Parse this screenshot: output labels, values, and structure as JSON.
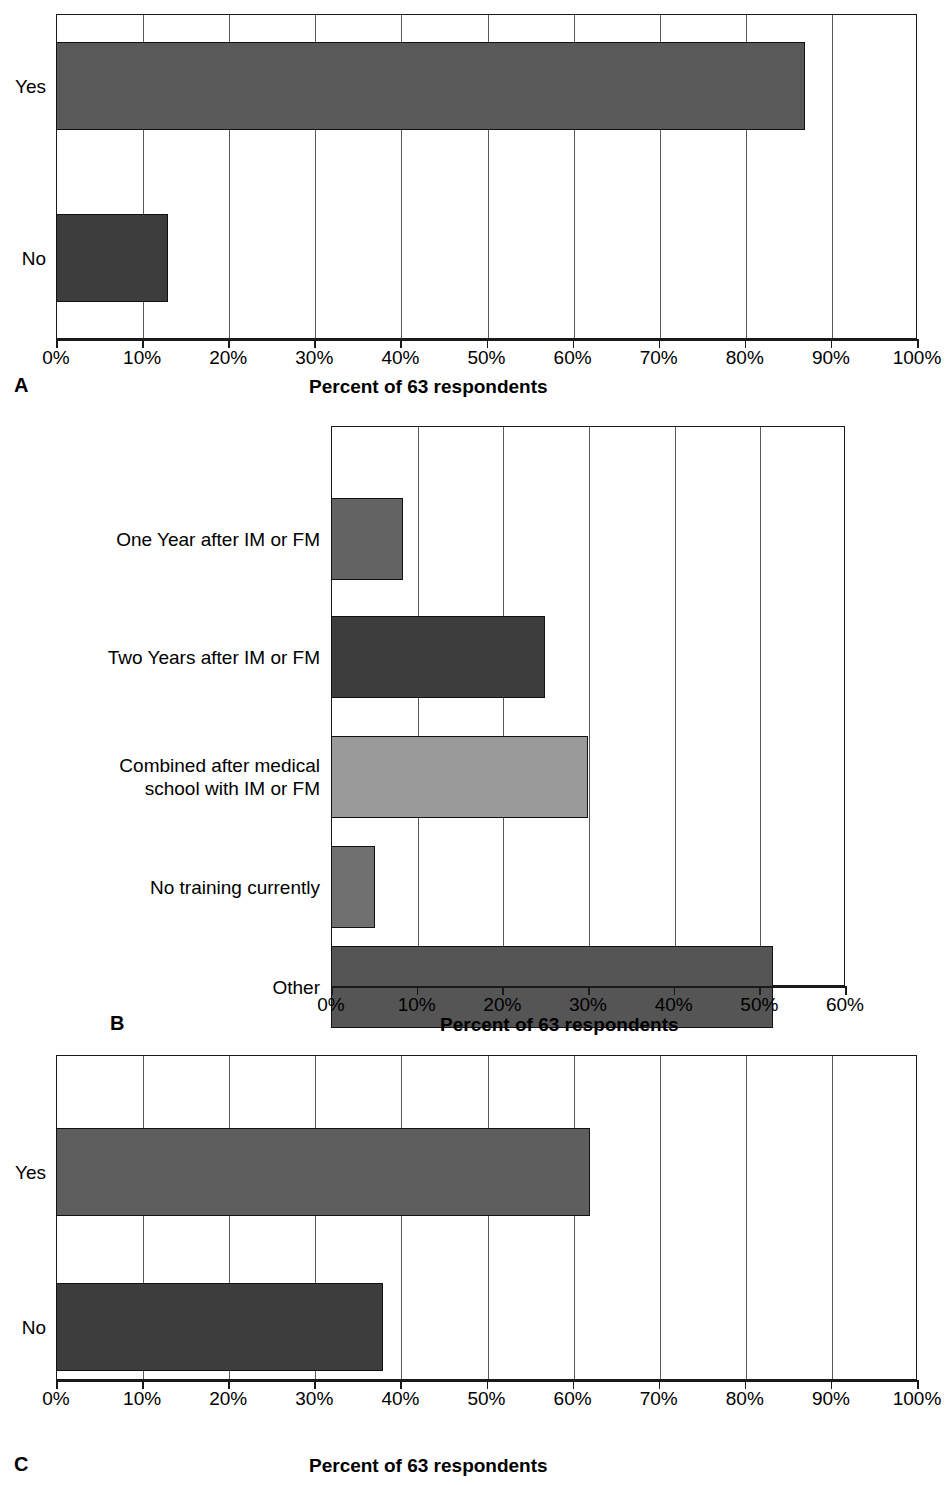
{
  "figure": {
    "background": "#ffffff",
    "panels": [
      {
        "letter": "A",
        "axis_title": "Percent of 63 respondents",
        "tick_labels": [
          "0%",
          "10%",
          "20%",
          "30%",
          "40%",
          "50%",
          "60%",
          "70%",
          "80%",
          "90%",
          "100%"
        ],
        "categories": [
          "Yes",
          "No"
        ],
        "values": [
          87,
          13
        ],
        "colors": [
          "#595959",
          "#3d3d3d"
        ]
      },
      {
        "letter": "B",
        "axis_title": "Percent of 63 respondents",
        "tick_labels": [
          "0%",
          "10%",
          "20%",
          "30%",
          "40%",
          "50%",
          "60%"
        ],
        "categories": [
          "One Year after IM or FM",
          "Two Years after IM or FM",
          "Combined after medical\nschool with IM or FM",
          "No training currently",
          "Other"
        ],
        "values": [
          8.4,
          25,
          30,
          5.1,
          51.6
        ],
        "colors": [
          "#636363",
          "#3d3d3d",
          "#9a9a9a",
          "#707070",
          "#555555"
        ]
      },
      {
        "letter": "C",
        "axis_title": "Percent of 63 respondents",
        "tick_labels": [
          "0%",
          "10%",
          "20%",
          "30%",
          "40%",
          "50%",
          "60%",
          "70%",
          "80%",
          "90%",
          "100%"
        ],
        "categories": [
          "Yes",
          "No"
        ],
        "values": [
          62,
          38
        ],
        "colors": [
          "#5e5e5e",
          "#3d3d3d"
        ]
      }
    ]
  },
  "chart_data": [
    {
      "type": "bar",
      "orientation": "horizontal",
      "panel": "A",
      "title": "",
      "xlabel": "Percent of 63 respondents",
      "ylabel": "",
      "categories": [
        "Yes",
        "No"
      ],
      "values": [
        87,
        13
      ],
      "xlim": [
        0,
        100
      ],
      "xticks": [
        0,
        10,
        20,
        30,
        40,
        50,
        60,
        70,
        80,
        90,
        100
      ],
      "xtick_labels": [
        "0%",
        "10%",
        "20%",
        "30%",
        "40%",
        "50%",
        "60%",
        "70%",
        "80%",
        "90%",
        "100%"
      ],
      "grid": "vertical",
      "legend": "none",
      "n": 63
    },
    {
      "type": "bar",
      "orientation": "horizontal",
      "panel": "B",
      "title": "",
      "xlabel": "Percent of 63 respondents",
      "ylabel": "",
      "categories": [
        "One Year after IM or FM",
        "Two Years after IM or FM",
        "Combined after medical school with IM or FM",
        "No training currently",
        "Other"
      ],
      "values": [
        8.4,
        25,
        30,
        5.1,
        51.6
      ],
      "xlim": [
        0,
        60
      ],
      "xticks": [
        0,
        10,
        20,
        30,
        40,
        50,
        60
      ],
      "xtick_labels": [
        "0%",
        "10%",
        "20%",
        "30%",
        "40%",
        "50%",
        "60%"
      ],
      "grid": "vertical",
      "legend": "none",
      "n": 63
    },
    {
      "type": "bar",
      "orientation": "horizontal",
      "panel": "C",
      "title": "",
      "xlabel": "Percent of 63 respondents",
      "ylabel": "",
      "categories": [
        "Yes",
        "No"
      ],
      "values": [
        62,
        38
      ],
      "xlim": [
        0,
        100
      ],
      "xticks": [
        0,
        10,
        20,
        30,
        40,
        50,
        60,
        70,
        80,
        90,
        100
      ],
      "xtick_labels": [
        "0%",
        "10%",
        "20%",
        "30%",
        "40%",
        "50%",
        "60%",
        "70%",
        "80%",
        "90%",
        "100%"
      ],
      "grid": "vertical",
      "legend": "none",
      "n": 63
    }
  ]
}
